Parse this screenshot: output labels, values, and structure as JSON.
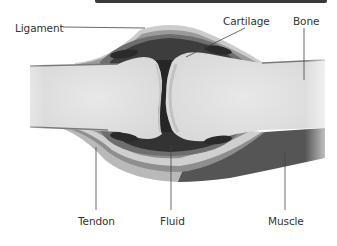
{
  "diagram": {
    "labels": {
      "ligament": "Ligament",
      "cartilage": "Cartilage",
      "bone": "Bone",
      "tendon": "Tendon",
      "fluid": "Fluid",
      "muscle": "Muscle"
    },
    "colors": {
      "bone": "#e4e4e4",
      "bone_shadow": "#cfcfcf",
      "fluid": "#262626",
      "membrane_dark": "#3d3d3d",
      "membrane_mid": "#6e6e6e",
      "capsule": "#9a9a9a",
      "ligament": "#cccccc",
      "tendon": "#b9b9b9",
      "muscle": "#555555",
      "leader_line": "#444444",
      "top_bar": "#3a3a3a"
    }
  }
}
